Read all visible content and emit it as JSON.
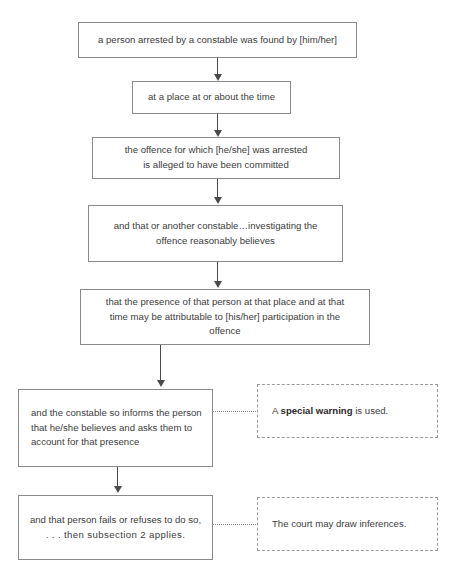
{
  "diagram": {
    "type": "flowchart",
    "orientation": "top-to-bottom",
    "colors": {
      "box_border": "#8a8a8a",
      "callout_border": "#9a9a9a",
      "connector": "#4a4a4a",
      "text": "#3d3d3d",
      "background": "#ffffff"
    },
    "nodes": [
      {
        "id": "node-1",
        "name": "arrested-found-by",
        "lines": [
          "a person arrested by a constable was found by [him/her]"
        ],
        "align": "center"
      },
      {
        "id": "node-2",
        "name": "place-and-time",
        "lines": [
          "at a place at or about the time"
        ],
        "align": "center"
      },
      {
        "id": "node-3",
        "name": "offence-alleged-committed",
        "lines": [
          "the offence for which [he/she] was arrested",
          "is alleged to have been committed"
        ],
        "align": "center"
      },
      {
        "id": "node-4",
        "name": "constable-reasonably-believes",
        "lines": [
          "and that or another constable…investigating the",
          "offence reasonably believes"
        ],
        "align": "center"
      },
      {
        "id": "node-5",
        "name": "presence-attributable-to-participation",
        "lines": [
          "that the presence of that person at that place and at that",
          "time may be attributable to [his/her] participation in the",
          "offence"
        ],
        "align": "center"
      },
      {
        "id": "node-6",
        "name": "constable-informs-and-asks-account",
        "lines": [
          "and the constable so informs the person",
          "that he/she believes and asks them to",
          "account for that presence"
        ],
        "align": "left"
      },
      {
        "id": "node-7",
        "name": "person-fails-or-refuses",
        "lines": [
          "and that person fails or refuses to do so,",
          ". . . then subsection 2 applies."
        ],
        "align": "center"
      }
    ],
    "callouts": [
      {
        "id": "callout-1",
        "name": "special-warning-note",
        "text_before": "A ",
        "text_bold": "special warning",
        "text_after": " is used."
      },
      {
        "id": "callout-2",
        "name": "court-inferences-note",
        "text_before": "The court may draw inferences.",
        "text_bold": "",
        "text_after": ""
      }
    ]
  }
}
